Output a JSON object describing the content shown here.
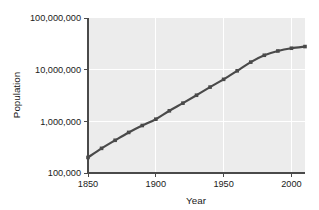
{
  "chart_data": {
    "type": "line",
    "title": "",
    "xlabel": "Year",
    "ylabel": "Population",
    "yscale": "log",
    "xscale": "linear",
    "xlim": [
      1850,
      2010
    ],
    "ylim": [
      100000,
      100000000
    ],
    "grid": true,
    "legend": null,
    "xticks": [
      1850,
      1900,
      1950,
      2000
    ],
    "xtick_labels": [
      "1850",
      "1900",
      "1950",
      "2000"
    ],
    "yticks": [
      100000,
      1000000,
      10000000,
      100000000
    ],
    "ytick_labels": [
      "100,000",
      "1,000,000",
      "10,000,000",
      "100,000,000"
    ],
    "series": [
      {
        "name": "Population",
        "marker": "square",
        "color": "#4a4a4a",
        "x": [
          1850,
          1860,
          1870,
          1880,
          1890,
          1900,
          1910,
          1920,
          1930,
          1940,
          1950,
          1960,
          1970,
          1980,
          1990,
          2000,
          2010
        ],
        "values": [
          200000,
          300000,
          430000,
          610000,
          830000,
          1100000,
          1600000,
          2250000,
          3200000,
          4600000,
          6500000,
          9500000,
          14000000,
          19000000,
          23000000,
          26000000,
          28000000
        ]
      }
    ]
  },
  "axes": {
    "x_title": "Year",
    "y_title": "Population"
  },
  "colors": {
    "plot_background": "#ececec",
    "gridline": "#ffffff",
    "axis": "#4a4a4a",
    "line": "#4a4a4a",
    "text": "#1a1a1a",
    "page_background": "#ffffff"
  }
}
